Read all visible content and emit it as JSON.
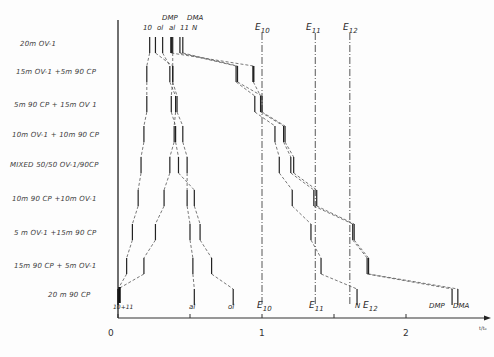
{
  "chart_data": {
    "type": "diagram",
    "title": "",
    "x_axis": {
      "ticks": [
        "0",
        "1",
        "2"
      ],
      "tick_values": [
        0,
        1,
        2
      ],
      "minor_ticks": [
        0.5,
        1.5
      ],
      "range": [
        0,
        2.5
      ],
      "unit_label": "t/t₀"
    },
    "rows": [
      {
        "label": "20m OV-1",
        "y": 45
      },
      {
        "label": "15m OV-1 +5m 90 CP",
        "y": 74
      },
      {
        "label": "5m 90 CP + 15m OV-1",
        "y": 104
      },
      {
        "label": "10m OV-1 + 10m 90 CP",
        "y": 134
      },
      {
        "label": "MIXED 50/50 OV-1/90CP",
        "y": 165
      },
      {
        "label": "10m 90 CP +10m OV-1",
        "y": 198
      },
      {
        "label": "5m OV-1 +15m 90 CP",
        "y": 232
      },
      {
        "label": "15m 90 CP + 5m OV-1",
        "y": 266
      },
      {
        "label": "20m 90 CP",
        "y": 297
      }
    ],
    "compounds": [
      "10",
      "ol",
      "DMP",
      "al",
      "11",
      "DMA",
      "N",
      "E10",
      "E11",
      "E12"
    ],
    "positions": {
      "10": [
        0.22,
        0.2,
        0.2,
        0.18,
        0.16,
        0.14,
        0.1,
        0.06,
        0.0
      ],
      "11": [
        0.31,
        0.36,
        0.4,
        0.39,
        0.36,
        0.32,
        0.26,
        0.18,
        0.0
      ],
      "al": [
        0.38,
        0.38,
        0.41,
        0.45,
        0.48,
        0.48,
        0.5,
        0.52,
        0.53
      ],
      "ol": [
        0.26,
        0.38,
        0.37,
        0.4,
        0.42,
        0.53,
        0.57,
        0.65,
        0.8
      ],
      "N": [
        0.43,
        0.82,
        0.95,
        1.09,
        1.12,
        1.21,
        1.34,
        1.41,
        1.66
      ],
      "DMP": [
        0.37,
        0.94,
        0.99,
        1.15,
        1.2,
        1.36,
        1.63,
        1.73,
        2.32
      ],
      "DMA": [
        0.45,
        0.83,
        1.0,
        1.16,
        1.22,
        1.38,
        1.64,
        1.74,
        2.36
      ],
      "E10": [
        1.0,
        1.0,
        1.0,
        1.0,
        1.0,
        1.0,
        1.0,
        1.0,
        1.0
      ],
      "E11": [
        1.37,
        1.37,
        1.37,
        1.37,
        1.37,
        1.37,
        1.37,
        1.37,
        1.37
      ],
      "E12": [
        1.61,
        1.61,
        1.61,
        1.61,
        1.61,
        1.61,
        1.61,
        1.61,
        1.61
      ]
    },
    "top_labels": [
      {
        "text": "10",
        "x": 0.22
      },
      {
        "text": "ol",
        "x": 0.26
      },
      {
        "text": "DMP",
        "x": 0.31
      },
      {
        "text": "al",
        "x": 0.35
      },
      {
        "text": "11",
        "x": 0.38
      },
      {
        "text": "DMA",
        "x": 0.44
      },
      {
        "text": "N",
        "x": 0.45
      }
    ],
    "bottom_labels": [
      {
        "text": "10+11",
        "x": 0.0
      },
      {
        "text": "al",
        "x": 0.52
      },
      {
        "text": "ol",
        "x": 0.8
      },
      {
        "text": "N",
        "x": 1.66
      },
      {
        "text": "DMP",
        "x": 2.2
      },
      {
        "text": "DMA",
        "x": 2.36
      }
    ],
    "reference_labels": [
      {
        "name": "E",
        "sub": "10",
        "x": 1.0
      },
      {
        "name": "E",
        "sub": "11",
        "x": 1.37
      },
      {
        "name": "E",
        "sub": "12",
        "x": 1.61
      }
    ],
    "grid": false,
    "legend": null
  },
  "axis": {
    "tick0": "0",
    "tick1": "1",
    "tick2": "2",
    "unit": "t/t₀"
  },
  "rows": [
    {
      "label": "20m  OV-1"
    },
    {
      "label": "15m  OV-1 +5m  90 CP"
    },
    {
      "label": "5m   90 CP    + 15m  OV 1"
    },
    {
      "label": "10m OV-1 + 10m  90 CP"
    },
    {
      "label": "MIXED  50/50  OV-1/90CP"
    },
    {
      "label": "10m   90 CP   +10m  OV-1"
    },
    {
      "label": "5 m OV-1 +15m  90  CP"
    },
    {
      "label": "15m    90 CP  +  5m OV-1"
    },
    {
      "label": "20 m   90  CP"
    }
  ],
  "top": {
    "l10": "10",
    "ol": "ol",
    "dmp": "DMP",
    "al": "al",
    "l11": "11",
    "dma": "DMA",
    "n": "N"
  },
  "bottom": {
    "l1011": "10+11",
    "al": "al",
    "ol": "ol",
    "n": "N",
    "dmp": "DMP",
    "dma": "DMA"
  },
  "refs": {
    "e": "E",
    "s10": "10",
    "s11": "11",
    "s12": "12"
  }
}
